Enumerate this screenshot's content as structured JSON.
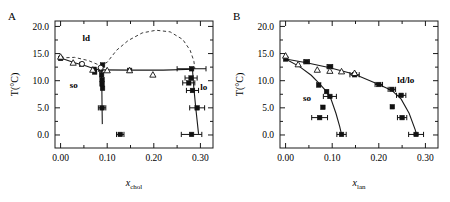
{
  "figure": {
    "background": "#ffffff",
    "width": 450,
    "height": 202,
    "marker_color": "#111111",
    "line_color": "#1a1a1a",
    "dash_color": "#3a3a3a"
  },
  "panels": [
    {
      "letter": "A",
      "xlabel_main": "x",
      "xlabel_sub": "chol",
      "ylabel": "T(°C)",
      "xticks": [
        "0.00",
        "0.10",
        "0.20",
        "0.30"
      ],
      "yticks": [
        "0.0",
        "5.0",
        "10.0",
        "15.0",
        "20.0"
      ],
      "regions": [
        {
          "name": "ld",
          "text": "ld"
        },
        {
          "name": "so",
          "text": "so"
        },
        {
          "name": "lo",
          "text": "lo"
        }
      ]
    },
    {
      "letter": "B",
      "xlabel_main": "x",
      "xlabel_sub": "lan",
      "ylabel": "T(°C)",
      "xticks": [
        "0.00",
        "0.10",
        "0.20",
        "0.30"
      ],
      "yticks": [
        "0.0",
        "5.0",
        "10.0",
        "15.0",
        "20.0"
      ],
      "regions": [
        {
          "name": "so",
          "text": "so"
        },
        {
          "name": "ld-lo",
          "text": "ld/lo"
        }
      ]
    }
  ],
  "chart_data": [
    {
      "type": "scatter",
      "panel": "A",
      "title": "",
      "xlabel": "x_chol",
      "ylabel": "T(°C)",
      "xlim": [
        -0.012,
        0.327
      ],
      "ylim": [
        -2.4,
        21.0
      ],
      "xticks": [
        0.0,
        0.1,
        0.2,
        0.3
      ],
      "yticks": [
        0.0,
        5.0,
        10.0,
        15.0,
        20.0
      ],
      "grid": false,
      "legend": null,
      "annotations": [
        {
          "text": "ld",
          "x": 0.055,
          "y": 17.3
        },
        {
          "text": "so",
          "x": 0.028,
          "y": 8.6
        },
        {
          "text": "lo",
          "x": 0.307,
          "y": 8.3
        }
      ],
      "series": [
        {
          "name": "filled-squares",
          "marker": "filled-square",
          "points": [
            {
              "x": 0.0,
              "y": 14.1,
              "xerr": 0.0
            },
            {
              "x": 0.045,
              "y": 13.0,
              "xerr": 0.0
            },
            {
              "x": 0.072,
              "y": 12.1,
              "xerr": 0.0
            },
            {
              "x": 0.073,
              "y": 11.6,
              "xerr": 0.0
            },
            {
              "x": 0.086,
              "y": 12.1,
              "xerr": 0.0
            },
            {
              "x": 0.09,
              "y": 12.9,
              "xerr": 0.0
            },
            {
              "x": 0.088,
              "y": 11.1,
              "xerr": 0.0
            },
            {
              "x": 0.089,
              "y": 10.2,
              "xerr": 0.0
            },
            {
              "x": 0.089,
              "y": 9.4,
              "xerr": 0.0
            },
            {
              "x": 0.09,
              "y": 8.6,
              "xerr": 0.0
            },
            {
              "x": 0.089,
              "y": 5.0,
              "xerr": 0.008
            },
            {
              "x": 0.128,
              "y": 0.1,
              "xerr": 0.008
            },
            {
              "x": 0.148,
              "y": 11.9,
              "xerr": 0.0
            },
            {
              "x": 0.281,
              "y": 12.2,
              "xerr": 0.031
            },
            {
              "x": 0.28,
              "y": 10.5,
              "xerr": 0.013
            },
            {
              "x": 0.275,
              "y": 9.6,
              "xerr": 0.013
            },
            {
              "x": 0.283,
              "y": 8.2,
              "xerr": 0.013
            },
            {
              "x": 0.293,
              "y": 5.0,
              "xerr": 0.016
            },
            {
              "x": 0.281,
              "y": 0.1,
              "xerr": 0.022
            }
          ]
        },
        {
          "name": "open-triangles",
          "marker": "open-triangle",
          "points": [
            {
              "x": 0.0,
              "y": 14.4
            },
            {
              "x": 0.027,
              "y": 13.3
            },
            {
              "x": 0.069,
              "y": 12.0
            },
            {
              "x": 0.1,
              "y": 11.9
            },
            {
              "x": 0.148,
              "y": 11.9
            },
            {
              "x": 0.198,
              "y": 11.1
            }
          ]
        },
        {
          "name": "open-circles",
          "marker": "open-circle",
          "points": [
            {
              "x": 0.046,
              "y": 13.1
            },
            {
              "x": 0.086,
              "y": 12.4
            }
          ]
        }
      ],
      "curves": [
        {
          "name": "so-ld-boundary",
          "style": "solid",
          "points": [
            [
              0.0,
              14.2
            ],
            [
              0.03,
              13.3
            ],
            [
              0.055,
              12.7
            ],
            [
              0.072,
              12.2
            ],
            [
              0.086,
              12.0
            ]
          ]
        },
        {
          "name": "three-phase-line",
          "style": "solid",
          "points": [
            [
              0.086,
              12.0
            ],
            [
              0.15,
              11.95
            ],
            [
              0.22,
              11.95
            ],
            [
              0.285,
              12.1
            ]
          ]
        },
        {
          "name": "so-lo-left-boundary",
          "style": "solid",
          "points": [
            [
              0.087,
              12.0
            ],
            [
              0.0885,
              9.0
            ],
            [
              0.089,
              5.0
            ],
            [
              0.0895,
              2.0
            ]
          ]
        },
        {
          "name": "lo-right-boundary",
          "style": "solid",
          "points": [
            [
              0.283,
              12.1
            ],
            [
              0.285,
              9.5
            ],
            [
              0.29,
              5.0
            ],
            [
              0.296,
              0.2
            ]
          ]
        },
        {
          "name": "ld-lo-dome",
          "style": "dashed",
          "points": [
            [
              0.0,
              14.2
            ],
            [
              0.03,
              14.3
            ],
            [
              0.06,
              13.7
            ],
            [
              0.085,
              12.8
            ],
            [
              0.1,
              13.4
            ],
            [
              0.12,
              15.6
            ],
            [
              0.145,
              17.4
            ],
            [
              0.175,
              18.8
            ],
            [
              0.205,
              19.3
            ],
            [
              0.235,
              19.0
            ],
            [
              0.262,
              17.6
            ],
            [
              0.278,
              15.6
            ],
            [
              0.286,
              13.6
            ],
            [
              0.288,
              12.2
            ]
          ]
        }
      ]
    },
    {
      "type": "scatter",
      "panel": "B",
      "title": "",
      "xlabel": "x_lan",
      "ylabel": "T(°C)",
      "xlim": [
        -0.012,
        0.327
      ],
      "ylim": [
        -2.4,
        21.0
      ],
      "xticks": [
        0.0,
        0.1,
        0.2,
        0.3
      ],
      "yticks": [
        0.0,
        5.0,
        10.0,
        15.0,
        20.0
      ],
      "grid": false,
      "legend": null,
      "annotations": [
        {
          "text": "so",
          "x": 0.046,
          "y": 6.2
        },
        {
          "text": "ld/lo",
          "x": 0.258,
          "y": 9.6
        }
      ],
      "series": [
        {
          "name": "filled-squares",
          "marker": "filled-square",
          "points": [
            {
              "x": 0.0,
              "y": 14.0,
              "xerr": 0.0
            },
            {
              "x": 0.045,
              "y": 13.5,
              "xerr": 0.006
            },
            {
              "x": 0.095,
              "y": 12.6,
              "xerr": 0.006
            },
            {
              "x": 0.148,
              "y": 11.1,
              "xerr": 0.01
            },
            {
              "x": 0.2,
              "y": 9.3,
              "xerr": 0.008
            },
            {
              "x": 0.228,
              "y": 8.4,
              "xerr": 0.008
            },
            {
              "x": 0.248,
              "y": 7.3,
              "xerr": 0.01
            },
            {
              "x": 0.071,
              "y": 9.2,
              "xerr": 0.0
            },
            {
              "x": 0.088,
              "y": 8.0,
              "xerr": 0.0
            },
            {
              "x": 0.095,
              "y": 7.1,
              "xerr": 0.014
            },
            {
              "x": 0.08,
              "y": 5.1,
              "xerr": 0.0
            },
            {
              "x": 0.073,
              "y": 3.2,
              "xerr": 0.017
            },
            {
              "x": 0.12,
              "y": 0.1,
              "xerr": 0.01
            },
            {
              "x": 0.229,
              "y": 5.2,
              "xerr": 0.0
            },
            {
              "x": 0.25,
              "y": 3.2,
              "xerr": 0.01
            },
            {
              "x": 0.28,
              "y": 0.1,
              "xerr": 0.016
            }
          ]
        },
        {
          "name": "open-triangles",
          "marker": "open-triangle",
          "points": [
            {
              "x": 0.0,
              "y": 14.6
            },
            {
              "x": 0.027,
              "y": 13.0
            },
            {
              "x": 0.068,
              "y": 12.0
            },
            {
              "x": 0.095,
              "y": 11.8
            },
            {
              "x": 0.12,
              "y": 11.7
            },
            {
              "x": 0.148,
              "y": 11.4
            }
          ]
        }
      ],
      "curves": [
        {
          "name": "upper-liquidus",
          "style": "solid",
          "points": [
            [
              0.0,
              14.0
            ],
            [
              0.045,
              13.3
            ],
            [
              0.095,
              12.4
            ],
            [
              0.148,
              11.2
            ],
            [
              0.2,
              9.3
            ],
            [
              0.228,
              8.2
            ],
            [
              0.248,
              6.6
            ],
            [
              0.265,
              4.0
            ],
            [
              0.278,
              1.0
            ],
            [
              0.281,
              0.1
            ]
          ]
        },
        {
          "name": "so-solidus",
          "style": "solid",
          "points": [
            [
              0.0,
              14.0
            ],
            [
              0.03,
              12.6
            ],
            [
              0.055,
              11.0
            ],
            [
              0.072,
              9.5
            ],
            [
              0.088,
              8.0
            ],
            [
              0.098,
              6.5
            ],
            [
              0.108,
              4.0
            ],
            [
              0.116,
              1.6
            ],
            [
              0.12,
              0.1
            ]
          ]
        }
      ]
    }
  ]
}
